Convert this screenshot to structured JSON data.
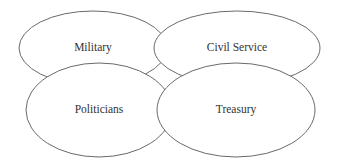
{
  "diagram": {
    "type": "overlapping-ellipses",
    "nodes": [
      {
        "id": "military",
        "label": "Military",
        "cx": 93,
        "cy": 48,
        "rx": 74,
        "ry": 37
      },
      {
        "id": "civil_service",
        "label": "Civil Service",
        "cx": 237,
        "cy": 48,
        "rx": 83,
        "ry": 37
      },
      {
        "id": "politicians",
        "label": "Politicians",
        "cx": 99,
        "cy": 110,
        "rx": 73,
        "ry": 47
      },
      {
        "id": "treasury",
        "label": "Treasury",
        "cx": 236,
        "cy": 110,
        "rx": 79,
        "ry": 47
      }
    ],
    "colors": {
      "stroke": "#6a6a6a",
      "fill": "#ffffff",
      "text": "#333333"
    }
  }
}
